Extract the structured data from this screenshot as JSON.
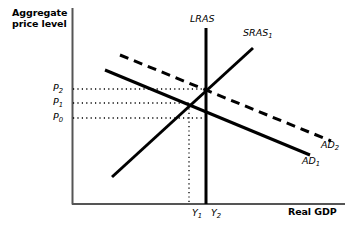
{
  "figure": {
    "type": "economics-diagram",
    "background_color": "#ffffff",
    "line_color": "#000000"
  },
  "axes": {
    "y_title_line1": "Aggregate",
    "y_title_line2": "price level",
    "x_title": "Real GDP",
    "origin": {
      "x": 72,
      "y": 204
    },
    "x_end": 345,
    "y_top": 8
  },
  "price_ticks": [
    {
      "id": "P2",
      "base": "P",
      "subscript": "2",
      "y": 89
    },
    {
      "id": "P1",
      "base": "P",
      "subscript": "1",
      "y": 103
    },
    {
      "id": "P0",
      "base": "P",
      "subscript": "0",
      "y": 118
    }
  ],
  "output_ticks": [
    {
      "id": "Y1",
      "base": "Y",
      "subscript": "1",
      "x": 189
    },
    {
      "id": "Y2",
      "base": "Y",
      "subscript": "2",
      "x": 206
    }
  ],
  "curves": [
    {
      "name": "LRAS",
      "label": "LRAS",
      "style": "solid",
      "stroke_width": 3,
      "x1": 206,
      "y1": 28,
      "x2": 206,
      "y2": 204
    },
    {
      "name": "SRAS1",
      "label_base": "SRAS",
      "label_subscript": "1",
      "style": "solid",
      "stroke_width": 3,
      "x1": 112,
      "y1": 177,
      "x2": 253,
      "y2": 48
    },
    {
      "name": "AD1",
      "label_base": "AD",
      "label_subscript": "1",
      "style": "solid",
      "stroke_width": 3,
      "x1": 105,
      "y1": 70,
      "x2": 310,
      "y2": 155
    },
    {
      "name": "AD2",
      "label_base": "AD",
      "label_subscript": "2",
      "style": "dashed",
      "stroke_width": 3,
      "dash": "9 6",
      "x1": 120,
      "y1": 55,
      "x2": 331,
      "y2": 141
    }
  ],
  "guide_lines": [
    {
      "name": "P2-guide",
      "orientation": "horizontal",
      "x1": 73,
      "y1": 89,
      "x2": 207,
      "y2": 89
    },
    {
      "name": "P1-guide",
      "orientation": "horizontal",
      "x1": 73,
      "y1": 103,
      "x2": 191,
      "y2": 103
    },
    {
      "name": "P0-guide",
      "orientation": "horizontal",
      "x1": 73,
      "y1": 118,
      "x2": 207,
      "y2": 118
    },
    {
      "name": "Y1-guide",
      "orientation": "vertical",
      "x1": 189,
      "y1": 104,
      "x2": 189,
      "y2": 203
    }
  ],
  "equilibria": [
    {
      "name": "initial-equilibrium",
      "x": 189,
      "y": 103,
      "price": "P1",
      "output": "Y1"
    },
    {
      "name": "new-equilibrium",
      "x": 206,
      "y": 89,
      "price": "P2",
      "output": "Y2"
    }
  ]
}
